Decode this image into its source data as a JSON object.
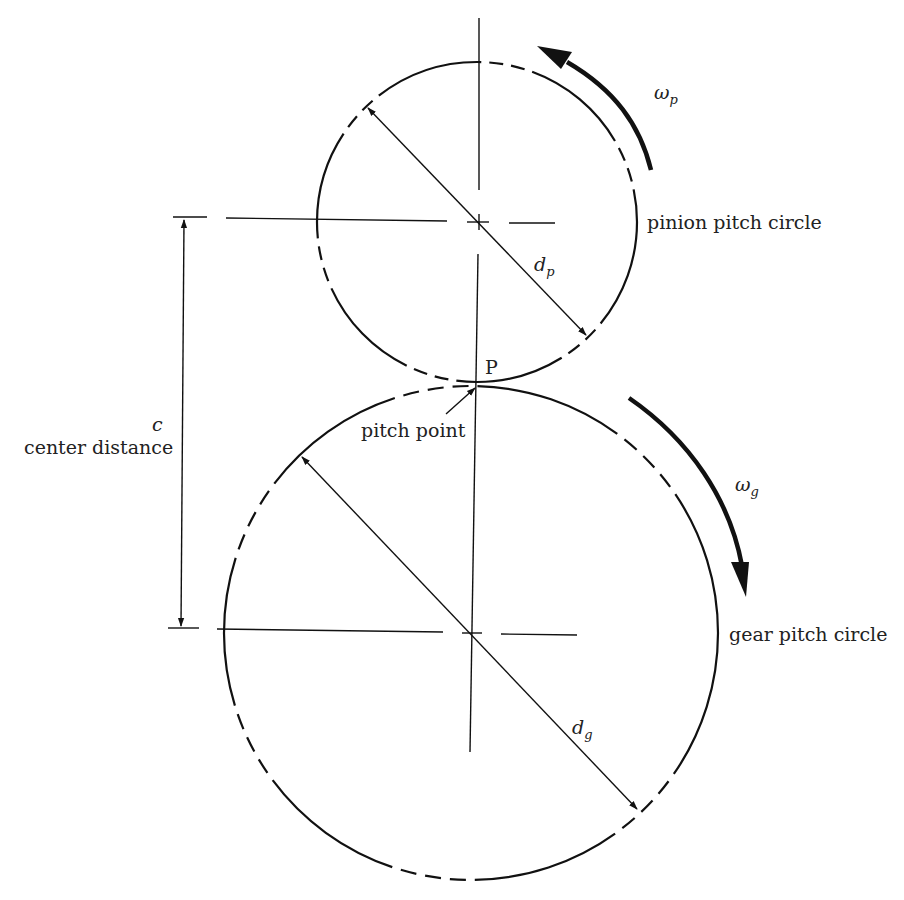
{
  "diagram": {
    "type": "spur gear pair — pitch circles",
    "pinion": {
      "label": "pinion pitch circle",
      "diameter_symbol": "d",
      "diameter_sub": "p",
      "omega_symbol": "ω",
      "omega_sub": "p",
      "rotation": "counterclockwise",
      "center": [
        477,
        222
      ],
      "radius": 160
    },
    "gear": {
      "label": "gear pitch circle",
      "diameter_symbol": "d",
      "diameter_sub": "g",
      "omega_symbol": "ω",
      "omega_sub": "g",
      "rotation": "clockwise",
      "center": [
        471,
        633
      ],
      "radius": 247
    },
    "pitch_point": {
      "letter": "P",
      "label": "pitch point"
    },
    "center_distance": {
      "symbol": "c",
      "label": "center distance"
    },
    "colors": {
      "line": "#111111",
      "text": "#222222",
      "background": "#ffffff"
    }
  }
}
